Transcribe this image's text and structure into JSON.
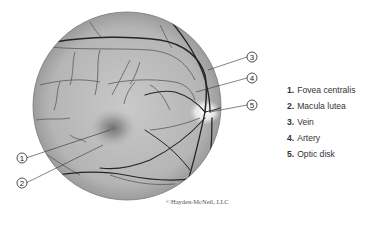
{
  "figure": {
    "callouts": [
      {
        "number": "1",
        "target": "fovea centralis"
      },
      {
        "number": "2",
        "target": "macula lutea"
      },
      {
        "number": "3",
        "target": "vein"
      },
      {
        "number": "4",
        "target": "artery"
      },
      {
        "number": "5",
        "target": "optic disk"
      }
    ]
  },
  "legend": {
    "items": [
      {
        "number": "1.",
        "label": "Fovea centralis"
      },
      {
        "number": "2.",
        "label": "Macula lutea"
      },
      {
        "number": "3.",
        "label": "Vein"
      },
      {
        "number": "4.",
        "label": "Artery"
      },
      {
        "number": "5.",
        "label": "Optic disk"
      }
    ]
  },
  "credit": "©Hayden-McNeil, LLC",
  "colors": {
    "fundus_light": "#d4d4d4",
    "fundus_dark": "#8a8a8a",
    "vessel": "#2a2a2a",
    "optic_disk": "#f2f2f2"
  }
}
